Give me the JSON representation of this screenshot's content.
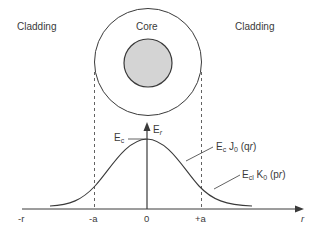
{
  "regions": {
    "left_cladding": "Cladding",
    "core": "Core",
    "right_cladding": "Cladding"
  },
  "axis": {
    "y_label_main": "E",
    "y_label_sub": "r",
    "x_label": "r",
    "ticks": [
      "-r",
      "-a",
      "0",
      "+a"
    ]
  },
  "annotations": {
    "peak": {
      "main": "E",
      "sub": "c"
    },
    "core_field": {
      "E": "E",
      "E_sub": "c",
      "fn": "J",
      "fn_sub": "0",
      "arg": "(q",
      "arg_var": "r",
      "close": ")"
    },
    "clad_field": {
      "E": "E",
      "E_sub": "cl",
      "fn": "K",
      "fn_sub": "0",
      "arg": "(p",
      "arg_var": "r",
      "close": ")"
    }
  },
  "colors": {
    "line": "#3a3a3a",
    "core_fill": "#d4d4d4",
    "background": "#ffffff"
  }
}
